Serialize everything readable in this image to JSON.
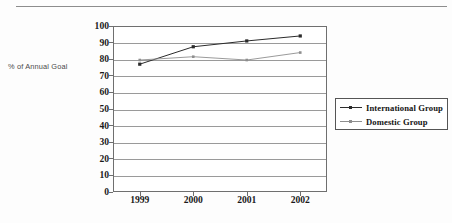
{
  "figure": {
    "y_axis_caption": "% of Annual Goal",
    "has_top_rule": true
  },
  "legend": {
    "position": "right",
    "entries": [
      {
        "label": "International Group",
        "color": "#2b2b2b",
        "marker": "square"
      },
      {
        "label": "Domestic Group",
        "color": "#8e8e8e",
        "marker": "square-small"
      }
    ]
  },
  "chart_data": {
    "type": "line",
    "title": "",
    "subtitle": "",
    "xlabel": "",
    "ylabel": "% of Annual Goal",
    "categories": [
      "1999",
      "2000",
      "2001",
      "2002"
    ],
    "x": [
      1999,
      2000,
      2001,
      2002
    ],
    "series": [
      {
        "name": "International Group",
        "values": [
          77,
          87.5,
          91,
          94
        ],
        "color": "#2b2b2b",
        "marker": "square"
      },
      {
        "name": "Domestic Group",
        "values": [
          79.5,
          81.5,
          79.5,
          84
        ],
        "color": "#8e8e8e",
        "marker": "square-small"
      }
    ],
    "ylim": [
      0,
      100
    ],
    "ytick_step": 10,
    "yticks": [
      0,
      10,
      20,
      30,
      40,
      50,
      60,
      70,
      80,
      90,
      100
    ],
    "ytick_labels": [
      "0",
      "10",
      "20",
      "30",
      "40",
      "50",
      "60",
      "70",
      "80",
      "90",
      "100"
    ],
    "xtick_labels": [
      "1999",
      "2000",
      "2001",
      "2002"
    ],
    "grid": {
      "horizontal": true,
      "vertical": false
    },
    "legend_position": "right",
    "annotations": []
  }
}
